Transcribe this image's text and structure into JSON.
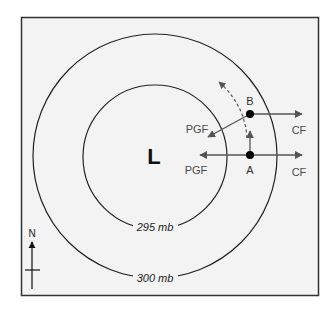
{
  "diagram": {
    "center_label": "L",
    "isobars": [
      {
        "label": "295 mb"
      },
      {
        "label": "300 mb"
      }
    ],
    "points": [
      {
        "name": "A"
      },
      {
        "name": "B"
      }
    ],
    "forces": {
      "pgf_a": "PGF",
      "pgf_b": "PGF",
      "cf_a": "CF",
      "cf_b": "CF"
    },
    "north_label": "N",
    "colors": {
      "frame_bg": "#f3f3f3",
      "frame_border": "#333333",
      "isobar": "#222222",
      "arrow": "#555555",
      "point": "#000000"
    }
  }
}
